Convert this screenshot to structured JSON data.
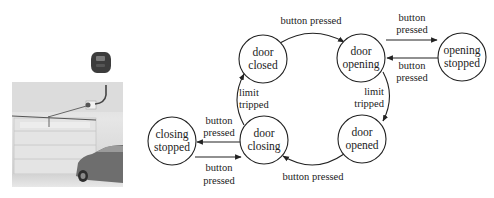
{
  "figure": {
    "photo": {
      "description": "garage interior with door opener rail, overhead door and parked car",
      "remote_control": "garage-remote"
    },
    "states": [
      {
        "id": "door_closed",
        "line1": "door",
        "line2": "closed"
      },
      {
        "id": "door_opening",
        "line1": "door",
        "line2": "opening"
      },
      {
        "id": "opening_stopped",
        "line1": "opening",
        "line2": "stopped"
      },
      {
        "id": "closing_stopped",
        "line1": "closing",
        "line2": "stopped"
      },
      {
        "id": "door_closing",
        "line1": "door",
        "line2": "closing"
      },
      {
        "id": "door_opened",
        "line1": "door",
        "line2": "opened"
      }
    ],
    "transitions": [
      {
        "from": "door_closed",
        "to": "door_opening",
        "line1": "button pressed",
        "line2": ""
      },
      {
        "from": "door_opening",
        "to": "opening_stopped",
        "line1": "button",
        "line2": "pressed"
      },
      {
        "from": "opening_stopped",
        "to": "door_opening",
        "line1": "button",
        "line2": "pressed"
      },
      {
        "from": "door_opening",
        "to": "door_opened",
        "line1": "limit",
        "line2": "tripped"
      },
      {
        "from": "door_opened",
        "to": "door_closing",
        "line1": "button pressed",
        "line2": ""
      },
      {
        "from": "door_closing",
        "to": "door_closed",
        "line1": "limit",
        "line2": "tripped"
      },
      {
        "from": "door_closing",
        "to": "closing_stopped",
        "line1": "button",
        "line2": "pressed"
      },
      {
        "from": "closing_stopped",
        "to": "door_closing",
        "line1": "button",
        "line2": "pressed"
      }
    ]
  }
}
